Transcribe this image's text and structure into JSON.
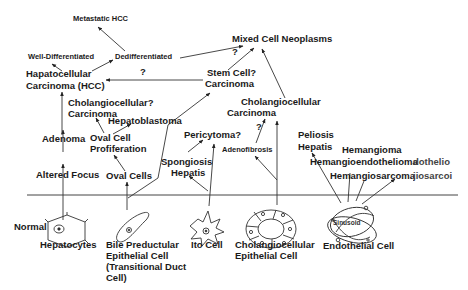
{
  "diagram": {
    "type": "cell-lineage-flow",
    "baseline_label": "",
    "source_cells": [
      {
        "id": "hepatocytes",
        "label": "Hepatocytes",
        "prefix_label": "Normal"
      },
      {
        "id": "bile-preductular",
        "label": "Bile Preductular Epithelial Cell (Transitional Duct Cell)",
        "lines": [
          "Bile Preductular",
          "Epithelial Cell",
          "(Transitional Duct",
          "Cell)"
        ]
      },
      {
        "id": "ito",
        "label": "Ito Cell"
      },
      {
        "id": "cholangiocellular-epithelial",
        "label": "Cholangiocellular Epithelial Cell",
        "lines": [
          "Cholangiocellular",
          "Epithelial Cell"
        ]
      },
      {
        "id": "endothelial",
        "label": "Endothelial Cell",
        "inner_label": "Sinusoid"
      }
    ],
    "nodes": {
      "metastatic_hcc": "Metastatic HCC",
      "well_differentiated": "Well-Differentiated",
      "dedifferentiated": "Dedifferentiated",
      "hcc_line1": "Hapatocellular",
      "hcc_line2": "Carcinoma (HCC)",
      "mixed_cell": "Mixed Cell Neoplasms",
      "stem_cell_line1": "Stem Cell?",
      "stem_cell_line2": "Carcinoma",
      "cholangio_q_line1": "Cholangiocellular?",
      "cholangio_q_line2": "Carcinoma",
      "hepatoblastoma": "Hepatoblastoma",
      "adenoma": "Adenoma",
      "oval_cell_prolif_line1": "Oval Cell",
      "oval_cell_prolif_line2": "Profiferation",
      "altered_focus": "Altered Focus",
      "oval_cells": "Oval Cells",
      "pericytoma": "Pericytoma?",
      "spongiosis_line1": "Spongiosis",
      "spongiosis_line2": "Hepatis",
      "cholangio_carc_line1": "Cholangiocellular",
      "cholangio_carc_line2": "Carcinoma",
      "adenofibrosis": "Adenofibrosis",
      "peliosis_line1": "Peliosis",
      "peliosis_line2": "Hepatis",
      "hemangioma": "Hemangioma",
      "hemangioendothelioma": "Hemangioendothelioma",
      "hemangiosarcoma": "Hemangiosarcoma",
      "ghost_endothelioma": "dothelio",
      "ghost_sarcoma": "jiosarcoi"
    },
    "uncertain_marks": {
      "hcc_from_stem": "?",
      "mixed_from_dediff": "?",
      "cholangio_from_adenofibrosis": "?"
    },
    "edges": [
      {
        "from": "Normal Hepatocytes",
        "to": "Altered Focus"
      },
      {
        "from": "Altered Focus",
        "to": "Adenoma"
      },
      {
        "from": "Adenoma",
        "to": "Hapatocellular Carcinoma (HCC)"
      },
      {
        "from": "Hapatocellular Carcinoma (HCC)",
        "to": "Well-Differentiated"
      },
      {
        "from": "Hapatocellular Carcinoma (HCC)",
        "to": "Dedifferentiated"
      },
      {
        "from": "Dedifferentiated",
        "to": "Metastatic HCC"
      },
      {
        "from": "Dedifferentiated",
        "to": "Mixed Cell Neoplasms",
        "uncertain": true
      },
      {
        "from": "Bile Preductular Epithelial Cell",
        "to": "Oval Cells"
      },
      {
        "from": "Oval Cells",
        "to": "Oval Cell Profiferation"
      },
      {
        "from": "Oval Cell Profiferation",
        "to": "Cholangiocellular? Carcinoma"
      },
      {
        "from": "Oval Cell Profiferation",
        "to": "Hepatoblastoma"
      },
      {
        "from": "Bile Preductular Epithelial Cell",
        "to": "Stem Cell? Carcinoma"
      },
      {
        "from": "Stem Cell? Carcinoma",
        "to": "Hapatocellular Carcinoma (HCC)",
        "uncertain": true
      },
      {
        "from": "Stem Cell? Carcinoma",
        "to": "Mixed Cell Neoplasms"
      },
      {
        "from": "Ito Cell",
        "to": "Spongiosis Hepatis"
      },
      {
        "from": "Ito Cell",
        "to": "Pericytoma?"
      },
      {
        "from": "Spongiosis Hepatis",
        "to": "Pericytoma?"
      },
      {
        "from": "Cholangiocellular Epithelial Cell",
        "to": "Adenofibrosis"
      },
      {
        "from": "Cholangiocellular Epithelial Cell",
        "to": "Cholangiocellular Carcinoma"
      },
      {
        "from": "Adenofibrosis",
        "to": "Cholangiocellular Carcinoma",
        "uncertain": true
      },
      {
        "from": "Cholangiocellular Carcinoma",
        "to": "Mixed Cell Neoplasms"
      },
      {
        "from": "Endothelial Cell",
        "to": "Peliosis Hepatis"
      },
      {
        "from": "Endothelial Cell",
        "to": "Hemangioendothelioma"
      },
      {
        "from": "Endothelial Cell",
        "to": "Hemangioma"
      },
      {
        "from": "Endothelial Cell",
        "to": "Hemangiosarcoma"
      }
    ]
  }
}
